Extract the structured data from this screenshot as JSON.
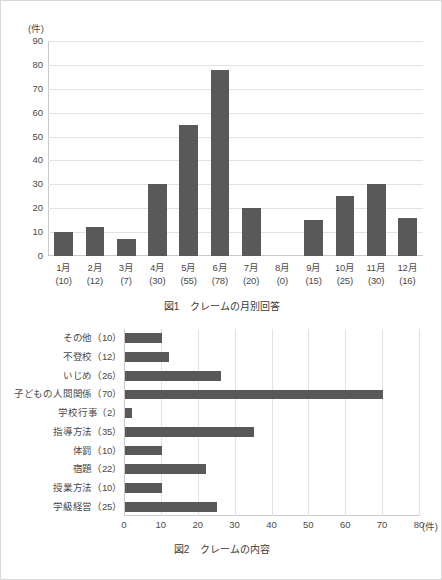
{
  "figure1": {
    "caption_number": "図1",
    "caption_title": "クレームの月別回答",
    "unit_label": "(件)",
    "chart_data": {
      "type": "bar",
      "orientation": "vertical",
      "title": "図1　クレームの月別回答",
      "xlabel": "",
      "ylabel": "(件)",
      "ylim": [
        0,
        90
      ],
      "yticks": [
        0,
        10,
        20,
        30,
        40,
        50,
        60,
        70,
        80,
        90
      ],
      "grid": true,
      "legend": "none",
      "categories": [
        "1月",
        "2月",
        "3月",
        "4月",
        "5月",
        "6月",
        "7月",
        "8月",
        "9月",
        "10月",
        "11月",
        "12月"
      ],
      "category_sublabels": [
        "(10)",
        "(12)",
        "(7)",
        "(30)",
        "(55)",
        "(78)",
        "(20)",
        "(0)",
        "(15)",
        "(25)",
        "(30)",
        "(16)"
      ],
      "values": [
        10,
        12,
        7,
        30,
        55,
        78,
        20,
        0,
        15,
        25,
        30,
        16
      ],
      "bar_color": "#595959"
    }
  },
  "figure2": {
    "caption_number": "図2",
    "caption_title": "クレームの内容",
    "unit_label": "(件)",
    "chart_data": {
      "type": "bar",
      "orientation": "horizontal",
      "title": "図2　クレームの内容",
      "xlabel": "(件)",
      "ylabel": "",
      "xlim": [
        0,
        80
      ],
      "xticks": [
        0,
        10,
        20,
        30,
        40,
        50,
        60,
        70,
        80
      ],
      "grid": true,
      "legend": "none",
      "categories": [
        "その他（10）",
        "不登校（12）",
        "いじめ（26）",
        "子どもの人間関係（70）",
        "学校行事（2）",
        "指導方法（35）",
        "体罰（10）",
        "宿題（22）",
        "授業方法（10）",
        "学級経営（25）"
      ],
      "values": [
        10,
        12,
        26,
        70,
        2,
        35,
        10,
        22,
        10,
        25
      ],
      "bar_color": "#595959"
    }
  },
  "colors": {
    "bar": "#595959",
    "gridline": "#e2e2e2",
    "axis": "#c9c9c9",
    "text": "#4a4a4a",
    "background": "#ffffff"
  }
}
